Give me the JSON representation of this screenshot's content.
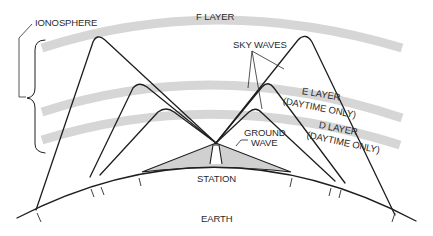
{
  "diagram": {
    "labels": {
      "ionosphere": "IONOSPHERE",
      "f_layer": "F LAYER",
      "sky_waves": "SKY WAVES",
      "e_layer": "E LAYER",
      "e_layer_note": "(DAYTIME ONLY)",
      "d_layer": "D LAYER",
      "d_layer_note": "(DAYTIME ONLY)",
      "ground_wave": "GROUND",
      "ground_wave_2": "WAVE",
      "station": "STATION",
      "earth": "EARTH"
    },
    "layers": [
      {
        "name": "F LAYER",
        "order": 1,
        "note": ""
      },
      {
        "name": "E LAYER",
        "order": 2,
        "note": "(DAYTIME ONLY)"
      },
      {
        "name": "D LAYER",
        "order": 3,
        "note": "(DAYTIME ONLY)"
      }
    ],
    "waves": [
      {
        "type": "sky wave",
        "reflects_off": "F LAYER",
        "count": 2
      },
      {
        "type": "sky wave",
        "reflects_off": "E LAYER",
        "count": 2
      },
      {
        "type": "sky wave",
        "reflects_off": "D LAYER",
        "count": 2
      },
      {
        "type": "ground wave",
        "reflects_off": "",
        "count": 1
      }
    ],
    "colors": {
      "layer_band": "#d6d6d6",
      "ground_wave_fill": "#d0d0d0",
      "line": "#1e1e1e",
      "background": "#ffffff"
    }
  }
}
